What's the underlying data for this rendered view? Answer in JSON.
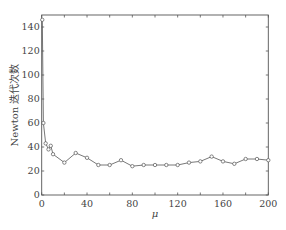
{
  "chart_data": {
    "type": "line",
    "title": "",
    "xlabel": "μ",
    "ylabel": "Newton 迭代次数",
    "xlim": [
      0,
      200
    ],
    "ylim": [
      0,
      150
    ],
    "xticks": [
      0,
      40,
      80,
      120,
      160,
      200
    ],
    "yticks": [
      0,
      20,
      40,
      60,
      80,
      100,
      120,
      140
    ],
    "grid": false,
    "legend": null,
    "marker": "circle",
    "line_color": "#555555",
    "series": [
      {
        "name": "Newton 迭代次数",
        "x": [
          0.5,
          1.5,
          3.5,
          6,
          8,
          10,
          20,
          30,
          40,
          50,
          60,
          70,
          80,
          90,
          100,
          110,
          120,
          130,
          140,
          150,
          160,
          170,
          180,
          190,
          200
        ],
        "values": [
          146,
          60,
          43,
          38,
          41,
          34,
          27,
          35,
          31,
          25,
          25,
          29,
          24,
          25,
          25,
          25,
          25,
          27,
          28,
          32,
          28,
          26,
          30,
          30,
          29
        ]
      }
    ]
  }
}
